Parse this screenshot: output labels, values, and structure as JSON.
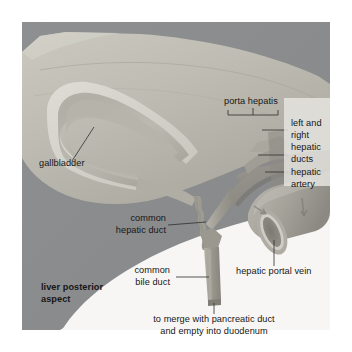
{
  "figure": {
    "background_color": "#ffffff",
    "plate_color": "#f4f3f1",
    "liver_color": "#b9b7ad",
    "shadow_color": "#8c8d8f",
    "duct_color": "#9a9a93",
    "vessel_color": "#a9a7a2",
    "label_color": "#161616"
  },
  "labels": {
    "porta_hepatis": "porta hepatis",
    "left_and_right_hepatic_ducts": "left and\nright\nhepatic\nducts",
    "left_and_right_hepatic_ducts_lines": [
      "left and",
      "right",
      "hepatic",
      "ducts"
    ],
    "hepatic_artery": "hepatic\nartery",
    "hepatic_artery_lines": [
      "hepatic",
      "artery"
    ],
    "gallbladder": "gallbladder",
    "common_hepatic_duct": "common\nhepatic duct",
    "common_hepatic_duct_lines": [
      "common",
      "hepatic duct"
    ],
    "common_bile_duct": "common\nbile duct",
    "common_bile_duct_lines": [
      "common",
      "bile duct"
    ],
    "hepatic_portal_vein": "hepatic portal vein",
    "liver_posterior_aspect": "liver posterior\naspect",
    "liver_posterior_aspect_lines": [
      "liver posterior",
      "aspect"
    ],
    "caption": "to merge with pancreatic duct\nand empty into duodenum",
    "caption_lines": [
      "to merge with pancreatic duct",
      "and empty into duodenum"
    ]
  }
}
